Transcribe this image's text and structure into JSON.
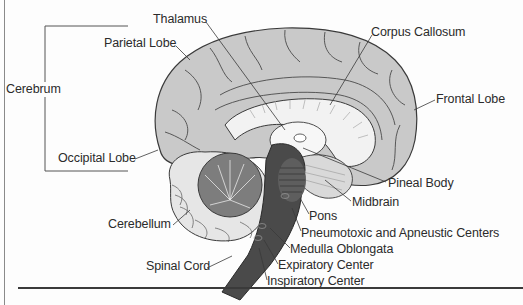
{
  "figure": {
    "group_bracket": {
      "label": "Cerebrum",
      "members": [
        "Parietal Lobe",
        "Occipital Lobe"
      ]
    },
    "labels": {
      "cerebrum": "Cerebrum",
      "thalamus": "Thalamus",
      "parietal_lobe": "Parietal Lobe",
      "corpus_callosum": "Corpus Callosum",
      "frontal_lobe": "Frontal Lobe",
      "occipital_lobe": "Occipital Lobe",
      "pineal_body": "Pineal Body",
      "midbrain": "Midbrain",
      "pons": "Pons",
      "pneumotoxic_apneustic": "Pneumotoxic and Apneustic Centers",
      "cerebellum": "Cerebellum",
      "medulla_oblongata": "Medulla Oblongata",
      "spinal_cord": "Spinal Cord",
      "expiratory_center": "Expiratory Center",
      "inspiratory_center": "Inspiratory Center"
    },
    "colors": {
      "cortex": "#c9c9c9",
      "cortex_line": "#3a3a3a",
      "white_matter": "#f2f2f2",
      "cerebellum_arbor": "#7d7d7d",
      "brainstem": "#4a4a4a",
      "text": "#2b2b2b",
      "background": "#fdfdfd"
    }
  }
}
